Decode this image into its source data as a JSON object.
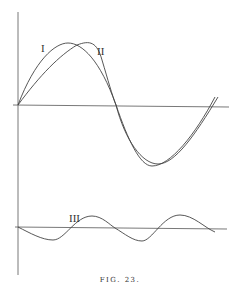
{
  "figure": {
    "caption": "FIG. 23.",
    "labels": {
      "curve1": "I",
      "curve2": "II",
      "curve3": "III"
    },
    "colors": {
      "line": "#444444",
      "background": "#ffffff"
    }
  }
}
